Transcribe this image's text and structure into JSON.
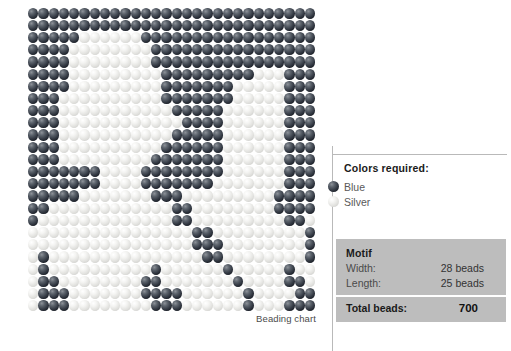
{
  "chart": {
    "caption": "Beading chart",
    "colors": {
      "blue_hex": "#1b1f27",
      "silver_hex": "#e2e2df"
    },
    "grid": {
      "columns": 28,
      "rows": 25,
      "legend_key": {
        "b": "Blue",
        "s": "Silver"
      },
      "pattern": [
        "bbbbbbbbbbbbbbbbbbbbbbbbbbbb",
        "bbbbbbbbbbbbbbbbbbbbbbbbbbbb",
        "bbbbbssssssbbbbbbbbbbbbbbbbb",
        "bbbbssssssssbbbbbbbbbbbbbbbb",
        "bbbbssssssssbbbbbbbbbbbbbbbb",
        "bbbbsssssssssbbbbbbbbbsssbbb",
        "bbbbsssssssssbbbbbbbsssssbbb",
        "bbbssssssssssbbbbbbbsssssbbb",
        "bbbsssssssssssbbbbbssssssbbb",
        "bbbssssssssssssbbbbssssssbbb",
        "bbbsssssssssssbbbbbssssssbbb",
        "bbbssssssssssbbbbbbssssssbbb",
        "bbbsssssssssbbbbbbbssssssbbb",
        "bbbbbbbssssbbbbbbbbssssssbbb",
        "bbbbbbbssssbbbbbbbsssssssbbb",
        "bbbbbsssssssbbbsssssssssbbbb",
        "bbssssssssssssbbssssssssbbbb",
        "bsssssssssssssbbsssssssssbbs",
        "ssssssssssssssssbbsssssssssb",
        "ssssssssssssssssbbbssssssssb",
        "sbsssssssssssssssbbssssssssb",
        "sbssssssssssbssssssbsssssbss",
        "sbbssssssssbbsssssssbssssbbs",
        "sbbbsssssssbbbbssssssbssssbb",
        "sbbbssssssssbbbssssssbsssbbbb"
      ]
    }
  },
  "legend": {
    "title": "Colors required:",
    "items": [
      {
        "name": "Blue",
        "swatch": "blue-bead-icon"
      },
      {
        "name": "Silver",
        "swatch": "silver-bead-icon"
      }
    ]
  },
  "motif": {
    "heading": "Motif",
    "rows": [
      {
        "label": "Width:",
        "value": "28 beads"
      },
      {
        "label": "Length:",
        "value": "25 beads"
      }
    ],
    "total_label": "Total beads:",
    "total_value": "700"
  }
}
